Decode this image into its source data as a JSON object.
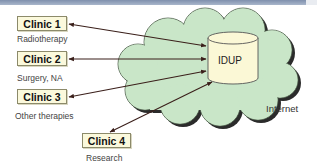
{
  "header": {
    "bar_color": "#8a9ab5"
  },
  "colors": {
    "cloud_fill": "#c9e6c8",
    "cloud_shadow": "#2b2b2b",
    "cylinder_fill": "#fbf8d6",
    "box_fill": "#fbf9dc",
    "arrow": "#3a1f1a"
  },
  "cloud": {
    "label": "Internet"
  },
  "database": {
    "label": "IDUP"
  },
  "clinics": [
    {
      "label": "Clinic 1",
      "description": "Radiotherapy"
    },
    {
      "label": "Clinic 2",
      "description": "Surgery, NA"
    },
    {
      "label": "Clinic 3",
      "description": "Other therapies"
    },
    {
      "label": "Clinic 4",
      "description": "Research"
    }
  ]
}
